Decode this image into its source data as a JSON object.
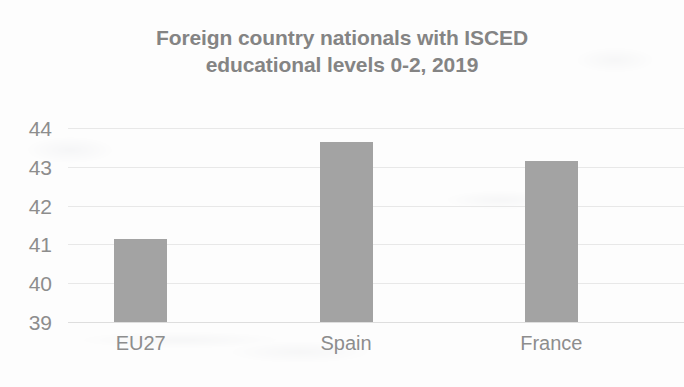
{
  "chart_data": {
    "type": "bar",
    "title": "Foreign country nationals with ISCED educational levels 0-2, 2019",
    "title_lines": [
      "Foreign country nationals with ISCED",
      "educational levels 0-2, 2019"
    ],
    "categories": [
      "EU27",
      "Spain",
      "France"
    ],
    "values": [
      41.15,
      43.65,
      43.15
    ],
    "series": [
      {
        "name": "Foreign country nationals with ISCED educational levels 0-2, 2019",
        "values": [
          41.15,
          43.65,
          43.15
        ]
      }
    ],
    "xlabel": "",
    "ylabel": "",
    "ylim": [
      39,
      44
    ],
    "ytick_labels": [
      "44",
      "43",
      "42",
      "41",
      "40",
      "39"
    ],
    "yticks": [
      44,
      43,
      42,
      41,
      40,
      39
    ],
    "ytick_step": 1,
    "grid": true,
    "grid_axis": "y",
    "legend": false,
    "legend_position": "none",
    "bar_color": "#a3a3a3",
    "gridline_color": "#e8e8e8",
    "title_color": "#848484",
    "tick_label_color": "#8d8d8d",
    "background_color": "#fdfdfd"
  }
}
